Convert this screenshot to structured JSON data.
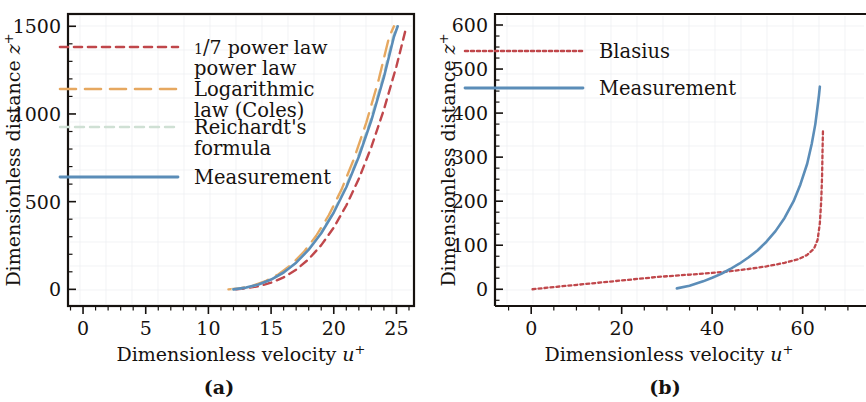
{
  "figure": {
    "background_color": "#ffffff",
    "panels": [
      {
        "caption": "(a)",
        "xlabel_main": "Dimensionless velocity ",
        "xlabel_sym": "u",
        "xlabel_sup": "+",
        "ylabel_main": "Dimensionless distance ",
        "ylabel_sym": "z",
        "ylabel_sup": "+"
      },
      {
        "caption": "(b)",
        "xlabel_main": "Dimensionless velocity ",
        "xlabel_sym": "u",
        "xlabel_sup": "+",
        "ylabel_main": "Dimensionless distance ",
        "ylabel_sym": "z",
        "ylabel_sup": "+"
      }
    ]
  },
  "chart_data": [
    {
      "type": "line",
      "panel": "a",
      "title": "",
      "xlabel": "Dimensionless velocity u+",
      "ylabel": "Dimensionless distance z+",
      "xlim": [
        -1.2,
        26.4
      ],
      "ylim": [
        -95,
        1570
      ],
      "xticks": [
        0,
        5,
        10,
        15,
        20,
        25
      ],
      "xtick_labels": [
        "0",
        "5",
        "10",
        "15",
        "20",
        "25"
      ],
      "xminor_step": 1,
      "yticks": [
        0,
        500,
        1000,
        1500
      ],
      "ytick_labels": [
        "0",
        "500",
        "1000",
        "1500"
      ],
      "yminor_step": 100,
      "grid": false,
      "legend_position": "upper-left-inside",
      "frame": "full-box",
      "series": [
        {
          "name": "1/7 power law",
          "label_prefix": "1/7",
          "label_rest": " power law",
          "color": "#c0474b",
          "dash": "8,6",
          "width": 2.4,
          "points": [
            [
              12.2,
              0
            ],
            [
              13.0,
              6
            ],
            [
              14.0,
              18
            ],
            [
              15.0,
              38
            ],
            [
              16.0,
              68
            ],
            [
              17.0,
              112
            ],
            [
              18.0,
              172
            ],
            [
              19.0,
              252
            ],
            [
              20.0,
              352
            ],
            [
              21.0,
              478
            ],
            [
              22.0,
              630
            ],
            [
              23.0,
              812
            ],
            [
              24.0,
              1025
            ],
            [
              25.0,
              1272
            ],
            [
              25.8,
              1500
            ]
          ]
        },
        {
          "name": "Logarithmic law (Coles)",
          "label_prefix": "Logarithmic",
          "label_rest": "law (Coles)",
          "color": "#e6a860",
          "dash": "16,9",
          "width": 2.4,
          "points": [
            [
              11.6,
              0
            ],
            [
              12.6,
              7
            ],
            [
              13.6,
              22
            ],
            [
              14.6,
              48
            ],
            [
              15.6,
              86
            ],
            [
              16.6,
              140
            ],
            [
              17.6,
              212
            ],
            [
              18.6,
              305
            ],
            [
              19.6,
              422
            ],
            [
              20.6,
              566
            ],
            [
              21.6,
              742
            ],
            [
              22.6,
              952
            ],
            [
              23.6,
              1200
            ],
            [
              24.4,
              1435
            ],
            [
              24.8,
              1500
            ]
          ]
        },
        {
          "name": "Reichardt's formula",
          "label_prefix": "Reichardt's",
          "label_rest": "formula",
          "color": "#cfe0d4",
          "dash": "9,6",
          "width": 2.2,
          "points": [
            [
              11.9,
              0
            ],
            [
              12.9,
              8
            ],
            [
              13.9,
              24
            ],
            [
              14.9,
              52
            ],
            [
              15.9,
              92
            ],
            [
              16.9,
              148
            ],
            [
              17.9,
              222
            ],
            [
              18.9,
              316
            ],
            [
              19.9,
              434
            ],
            [
              20.9,
              578
            ],
            [
              21.9,
              752
            ],
            [
              22.9,
              960
            ],
            [
              23.9,
              1206
            ],
            [
              24.7,
              1435
            ],
            [
              25.0,
              1500
            ]
          ]
        },
        {
          "name": "Measurement",
          "label_prefix": "Measurement",
          "label_rest": "",
          "color": "#5b8db8",
          "dash": "none",
          "width": 2.6,
          "points": [
            [
              12.0,
              0
            ],
            [
              13.0,
              10
            ],
            [
              14.0,
              28
            ],
            [
              15.0,
              56
            ],
            [
              16.0,
              96
            ],
            [
              17.0,
              152
            ],
            [
              18.0,
              226
            ],
            [
              19.0,
              320
            ],
            [
              20.0,
              438
            ],
            [
              21.0,
              582
            ],
            [
              22.0,
              756
            ],
            [
              23.0,
              964
            ],
            [
              24.0,
              1210
            ],
            [
              24.8,
              1440
            ],
            [
              25.1,
              1500
            ]
          ]
        }
      ]
    },
    {
      "type": "line",
      "panel": "b",
      "title": "",
      "xlabel": "Dimensionless velocity u+",
      "ylabel": "Dimensionless distance z+",
      "xlim": [
        -8,
        74
      ],
      "ylim": [
        -38,
        625
      ],
      "xticks": [
        0,
        20,
        40,
        60
      ],
      "xtick_labels": [
        "0",
        "20",
        "40",
        "60"
      ],
      "xminor_step": 5,
      "yticks": [
        0,
        100,
        200,
        300,
        400,
        500,
        600
      ],
      "ytick_labels": [
        "0",
        "100",
        "200",
        "300",
        "400",
        "500",
        "600"
      ],
      "yminor_step": 25,
      "grid": false,
      "legend_position": "upper-left-inside",
      "frame": "left-top-open-right",
      "series": [
        {
          "name": "Blasius",
          "label_prefix": "Blasius",
          "label_rest": "",
          "color": "#c0474b",
          "dash": "3,3",
          "width": 2.3,
          "points": [
            [
              0.3,
              0
            ],
            [
              4,
              4
            ],
            [
              8,
              8
            ],
            [
              12,
              12
            ],
            [
              16,
              16
            ],
            [
              20,
              20
            ],
            [
              24,
              24
            ],
            [
              28,
              28
            ],
            [
              32,
              31
            ],
            [
              36,
              34
            ],
            [
              40,
              37
            ],
            [
              44,
              41
            ],
            [
              48,
              46
            ],
            [
              52,
              52
            ],
            [
              56,
              60
            ],
            [
              59,
              68
            ],
            [
              61,
              78
            ],
            [
              62.5,
              92
            ],
            [
              63.3,
              112
            ],
            [
              63.8,
              150
            ],
            [
              64.1,
              200
            ],
            [
              64.3,
              260
            ],
            [
              64.4,
              320
            ],
            [
              64.5,
              365
            ]
          ]
        },
        {
          "name": "Measurement",
          "label_prefix": "Measurement",
          "label_rest": "",
          "color": "#5b8db8",
          "dash": "none",
          "width": 2.6,
          "points": [
            [
              32.2,
              2
            ],
            [
              35,
              8
            ],
            [
              38,
              18
            ],
            [
              40,
              26
            ],
            [
              42,
              35
            ],
            [
              44,
              46
            ],
            [
              46,
              58
            ],
            [
              48,
              72
            ],
            [
              50,
              88
            ],
            [
              52,
              108
            ],
            [
              54,
              132
            ],
            [
              56,
              162
            ],
            [
              58,
              200
            ],
            [
              59.5,
              238
            ],
            [
              61,
              285
            ],
            [
              62,
              330
            ],
            [
              62.8,
              375
            ],
            [
              63.3,
              415
            ],
            [
              63.6,
              440
            ],
            [
              63.8,
              460
            ]
          ]
        }
      ]
    }
  ]
}
